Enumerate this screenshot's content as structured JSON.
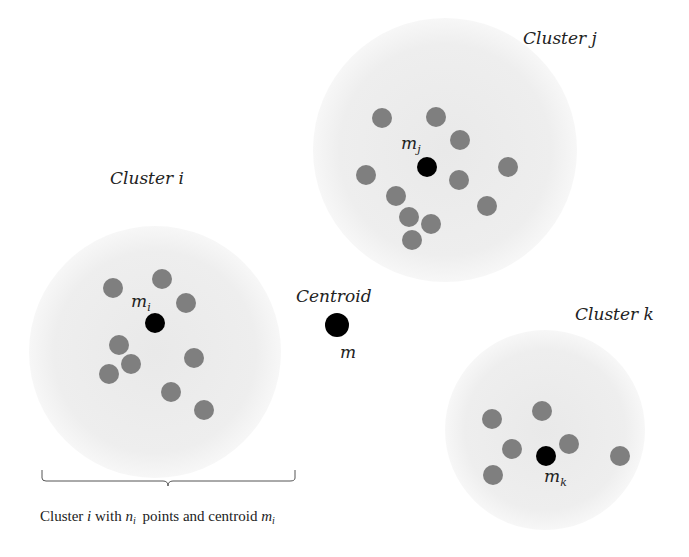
{
  "diagram": {
    "type": "cluster-centroid-illustration",
    "colors": {
      "background": "#ffffff",
      "cluster_region": "#ececec",
      "point": "#7f7f7f",
      "centroid": "#000000",
      "text": "#222222"
    },
    "clusters": [
      {
        "id": "i",
        "title": "Cluster i",
        "centroid_label_base": "m",
        "centroid_label_sub": "i",
        "region": {
          "cx": 155,
          "cy": 352,
          "r": 126
        },
        "centroid": {
          "x": 155,
          "y": 323
        },
        "points": [
          [
            113,
            288
          ],
          [
            162,
            279
          ],
          [
            186,
            303
          ],
          [
            119,
            345
          ],
          [
            131,
            364
          ],
          [
            109,
            374
          ],
          [
            194,
            358
          ],
          [
            171,
            392
          ],
          [
            204,
            410
          ]
        ]
      },
      {
        "id": "j",
        "title": "Cluster j",
        "centroid_label_base": "m",
        "centroid_label_sub": "j",
        "region": {
          "cx": 445,
          "cy": 150,
          "r": 132
        },
        "centroid": {
          "x": 427,
          "y": 167
        },
        "points": [
          [
            382,
            118
          ],
          [
            436,
            117
          ],
          [
            460,
            140
          ],
          [
            366,
            175
          ],
          [
            396,
            196
          ],
          [
            409,
            217
          ],
          [
            431,
            224
          ],
          [
            412,
            240
          ],
          [
            459,
            180
          ],
          [
            487,
            206
          ],
          [
            508,
            167
          ]
        ]
      },
      {
        "id": "k",
        "title": "Cluster k",
        "centroid_label_base": "m",
        "centroid_label_sub": "k",
        "region": {
          "cx": 545,
          "cy": 430,
          "r": 100
        },
        "centroid": {
          "x": 546,
          "y": 456
        },
        "points": [
          [
            492,
            419
          ],
          [
            542,
            411
          ],
          [
            512,
            449
          ],
          [
            569,
            444
          ],
          [
            493,
            475
          ],
          [
            620,
            456
          ]
        ]
      }
    ],
    "global_centroid": {
      "title": "Centroid",
      "label": "m",
      "x": 337,
      "y": 325
    },
    "caption": {
      "prefix": "Cluster ",
      "var_i": "i",
      "mid1": " with ",
      "var_n": "n",
      "sub_n": "i",
      "mid2": " points and centroid ",
      "var_m": "m",
      "sub_m": "i"
    }
  }
}
